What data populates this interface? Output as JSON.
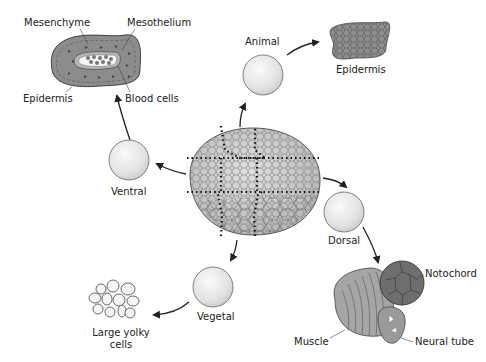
{
  "diagram": {
    "center": {
      "name": "blastula",
      "regions": 9
    },
    "nodes": [
      {
        "id": "animal",
        "label": "Animal",
        "product": "Epidermis"
      },
      {
        "id": "ventral",
        "label": "Ventral",
        "product": "Mesenchyme / Mesothelium / Epidermis / Blood cells"
      },
      {
        "id": "dorsal",
        "label": "Dorsal",
        "product": "Notochord / Muscle / Neural tube"
      },
      {
        "id": "vegetal",
        "label": "Vegetal",
        "product": "Large yolky cells"
      }
    ],
    "labels": {
      "animal": "Animal",
      "animal_product": "Epidermis",
      "ventral": "Ventral",
      "ventral_mesenchyme": "Mesenchyme",
      "ventral_mesothelium": "Mesothelium",
      "ventral_epidermis": "Epidermis",
      "ventral_blood": "Blood cells",
      "dorsal": "Dorsal",
      "dorsal_notochord": "Notochord",
      "dorsal_muscle": "Muscle",
      "dorsal_neural": "Neural tube",
      "vegetal": "Vegetal",
      "vegetal_product_line1": "Large yolky",
      "vegetal_product_line2": "cells"
    },
    "colors": {
      "sphere_fill": "#e6e6e6",
      "tissue_dark": "#8a8a8a",
      "tissue_mid": "#a8a8a8",
      "outline": "#333333",
      "arrow": "#222222"
    }
  }
}
